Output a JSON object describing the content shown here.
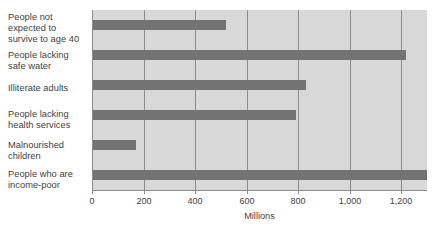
{
  "chart_data": {
    "type": "bar",
    "orientation": "horizontal",
    "title": "",
    "xlabel": "Millions",
    "ylabel": "",
    "categories": [
      "People not expected to survive to age 40",
      "People lacking safe water",
      "Illiterate adults",
      "People lacking health services",
      "Malnourished children",
      "People who are income-poor"
    ],
    "values": [
      520,
      1220,
      830,
      790,
      170,
      1300
    ],
    "xlim": [
      0,
      1300
    ],
    "xticks": [
      0,
      200,
      400,
      600,
      800,
      1000,
      1200
    ],
    "xtick_labels": [
      "0",
      "200",
      "400",
      "600",
      "800",
      "1,000",
      "1,200"
    ],
    "grid": true,
    "legend": "none",
    "bar_color": "#737373",
    "plot_background": "#d8d8d8",
    "gridline_color": "#8c8c8c",
    "axis_color": "#8a8a8a"
  },
  "labels": {
    "cat0_line1": "People not",
    "cat0_line2": "expected to",
    "cat0_line3": "survive to age 40",
    "cat1_line1": "People lacking",
    "cat1_line2": "safe water",
    "cat2_line1": "Illiterate adults",
    "cat3_line1": "People lacking",
    "cat3_line2": "health services",
    "cat4_line1": "Malnourished",
    "cat4_line2": "children",
    "cat5_line1": "People who are",
    "cat5_line2": "income-poor"
  },
  "axis": {
    "tick0": "0",
    "tick1": "200",
    "tick2": "400",
    "tick3": "600",
    "tick4": "800",
    "tick5": "1,000",
    "tick6": "1,200",
    "title": "Millions"
  }
}
